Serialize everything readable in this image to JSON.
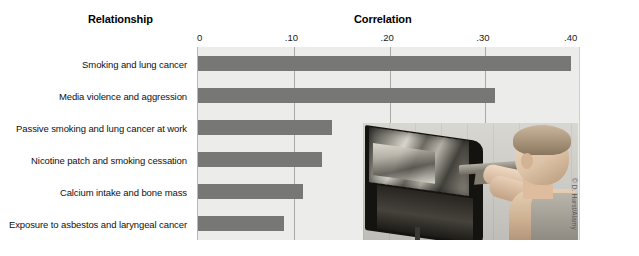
{
  "figure": {
    "left_header": "Relationship",
    "right_header": "Correlation",
    "credit": "© D. Hurst/Alamy",
    "photo_alt": "child-playing-shooting-video-game"
  },
  "colors": {
    "bar": "#777776",
    "plot_background": "#ececeb",
    "gridline": "#a9a9a5",
    "text": "#111111",
    "page_background": "#ffffff"
  },
  "chart_data": {
    "type": "bar",
    "orientation": "horizontal",
    "title": "Correlation",
    "xlabel": "Correlation",
    "ylabel": "Relationship",
    "xlim": [
      0,
      0.4
    ],
    "grid": true,
    "legend": "none",
    "tick_labels": [
      "0",
      ".10",
      ".20",
      ".30",
      ".40"
    ],
    "tick_values": [
      0,
      0.1,
      0.2,
      0.3,
      0.4
    ],
    "categories": [
      "Smoking and lung cancer",
      "Media violence and aggression",
      "Passive smoking and lung cancer at work",
      "Nicotine patch and smoking cessation",
      "Calcium intake and bone mass",
      "Exposure to asbestos and laryngeal cancer"
    ],
    "values": [
      0.39,
      0.31,
      0.14,
      0.13,
      0.11,
      0.09
    ]
  }
}
